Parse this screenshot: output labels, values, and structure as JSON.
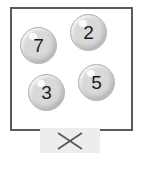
{
  "scene": {
    "title": "numbered-balls-panel",
    "background_color": "#ffffff"
  },
  "ball_box": {
    "name": "ball-container",
    "border_color": "#5a5a5a",
    "fill_color": "#ffffff",
    "x": 10,
    "y": 7,
    "width": 123,
    "height": 124
  },
  "balls": [
    {
      "label": "7",
      "name": "ball-7",
      "x": 20,
      "y": 27,
      "size": 37,
      "fill_color": "#d9d9d9",
      "text_color": "#1c1c1c"
    },
    {
      "label": "2",
      "name": "ball-2",
      "x": 70,
      "y": 14,
      "size": 37,
      "fill_color": "#d9d9d9",
      "text_color": "#1c1c1c"
    },
    {
      "label": "3",
      "name": "ball-3",
      "x": 28,
      "y": 74,
      "size": 37,
      "fill_color": "#d9d9d9",
      "text_color": "#1c1c1c"
    },
    {
      "label": "5",
      "name": "ball-5",
      "x": 78,
      "y": 64,
      "size": 37,
      "fill_color": "#d9d9d9",
      "text_color": "#1c1c1c"
    }
  ],
  "close_button": {
    "icon": "close-x-icon",
    "label": "",
    "background_color": "#ededed",
    "stroke_color": "#555555",
    "x": 40,
    "y": 128,
    "width": 60,
    "height": 25
  }
}
